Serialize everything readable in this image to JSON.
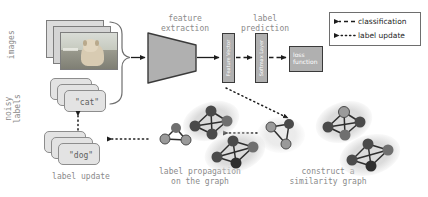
{
  "diagram": {
    "left_labels": {
      "images": "images",
      "noisy": "noisy",
      "labels": "labels"
    },
    "stage_labels": {
      "feature_extraction": "feature\nextraction",
      "label_prediction": "label\nprediction",
      "label_update": "label update",
      "label_propagation": "label propagation\non the graph",
      "construct_graph": "construct a\nsimilarity graph"
    },
    "blocks": {
      "dnn": "DNNs",
      "feature_vector": "Feature Vector",
      "softmax_layer": "Softmax Layer",
      "loss_function": "loss\nfunction"
    },
    "cards": {
      "cat": "\"cat\"",
      "dog": "\"dog\""
    },
    "legend": {
      "classification": "classification",
      "label_update": "label update"
    },
    "colors": {
      "block_fill": "#b0b0b0",
      "block_stroke": "#3a3a3a",
      "card_fill": "#e3e3e3",
      "card_stroke": "#8d8d8d",
      "text_gray": "#8a8a8a",
      "node_dark": "#4a4a4a",
      "node_mid": "#6f6f6f",
      "node_light": "#9a9a9a",
      "cluster_halo": "#d7d7d7",
      "arrow": "#1d1d1d"
    }
  },
  "graphs": {
    "seed_cluster": {
      "name": "seed-graph",
      "nodes": 4,
      "halo": false
    },
    "propagated": [
      {
        "name": "cluster-top-left",
        "nodes": 4
      },
      {
        "name": "cluster-bottom-left",
        "nodes": 4
      }
    ],
    "constructed": [
      {
        "name": "cluster-top-right",
        "nodes": 4
      },
      {
        "name": "cluster-bottom-right",
        "nodes": 4
      }
    ]
  }
}
